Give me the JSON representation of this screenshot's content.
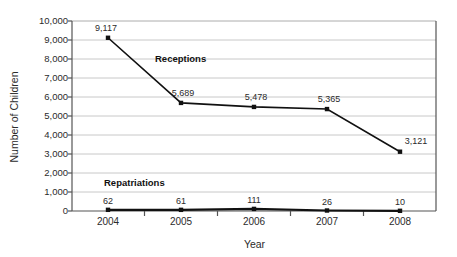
{
  "chart_data": {
    "type": "line",
    "title": "",
    "xlabel": "Year",
    "ylabel": "Number of Children",
    "categories": [
      "2004",
      "2005",
      "2006",
      "2007",
      "2008"
    ],
    "ylim": [
      0,
      10000
    ],
    "ytick_labels": [
      "10,000",
      "9,000",
      "8,000",
      "7,000",
      "6,000",
      "5,000",
      "4,000",
      "3,000",
      "2,000",
      "1,000",
      "0"
    ],
    "ytick_values": [
      10000,
      9000,
      8000,
      7000,
      6000,
      5000,
      4000,
      3000,
      2000,
      1000,
      0
    ],
    "grid": true,
    "legend_position": "inline-annotations",
    "series": [
      {
        "name": "Receptions",
        "values": [
          9117,
          5689,
          5478,
          5365,
          3121
        ],
        "point_labels": [
          "9,117",
          "5,689",
          "5,478",
          "5,365",
          "3,121"
        ],
        "color": "#111111"
      },
      {
        "name": "Repatriations",
        "values": [
          62,
          61,
          111,
          26,
          10
        ],
        "point_labels": [
          "62",
          "61",
          "111",
          "26",
          "10"
        ],
        "color": "#111111"
      }
    ],
    "annotations": [
      {
        "text": "Receptions",
        "x_px": 155,
        "y_px": 53
      },
      {
        "text": "Repatriations",
        "x_px": 104,
        "y_px": 177
      }
    ]
  },
  "colors": {
    "axis": "#444444",
    "grid": "#c8c8c8",
    "line": "#111111",
    "background": "#ffffff"
  }
}
